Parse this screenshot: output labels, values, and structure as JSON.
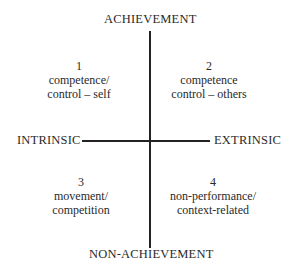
{
  "diagram": {
    "axes": {
      "top": "ACHIEVEMENT",
      "bottom": "NON-ACHIEVEMENT",
      "left": "INTRINSIC",
      "right": "EXTRINSIC"
    },
    "quadrants": [
      {
        "number": "1",
        "line1": "competence/",
        "line2": "control – self"
      },
      {
        "number": "2",
        "line1": "competence",
        "line2": "control – others"
      },
      {
        "number": "3",
        "line1": "movement/",
        "line2": "competition"
      },
      {
        "number": "4",
        "line1": "non-performance/",
        "line2": "context-related"
      }
    ]
  }
}
